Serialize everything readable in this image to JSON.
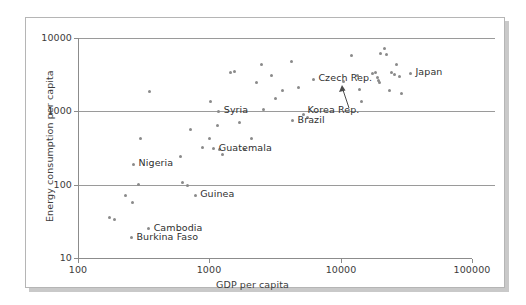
{
  "chart_data": {
    "type": "scatter",
    "title": "",
    "xlabel": "GDP per capita",
    "ylabel": "Energy consumption per capita",
    "xscale": "log",
    "yscale": "log",
    "xlim": [
      100,
      100000
    ],
    "ylim": [
      10,
      10000
    ],
    "xticks": [
      "100",
      "1000",
      "10000",
      "100000"
    ],
    "yticks": [
      "10",
      "100",
      "1000",
      "10000"
    ],
    "grid": "horizontal",
    "legend": "none",
    "labeled_points": [
      {
        "label": "Nigeria",
        "x": 265,
        "y": 190,
        "label_side": "right"
      },
      {
        "label": "Guinea",
        "x": 780,
        "y": 72,
        "label_side": "right"
      },
      {
        "label": "Cambodia",
        "x": 345,
        "y": 25,
        "label_side": "right"
      },
      {
        "label": "Burkina Faso",
        "x": 255,
        "y": 19,
        "label_side": "right"
      },
      {
        "label": "Guatemala",
        "x": 1080,
        "y": 310,
        "label_side": "right"
      },
      {
        "label": "Syria",
        "x": 1180,
        "y": 1000,
        "label_side": "right"
      },
      {
        "label": "Brazil",
        "x": 4300,
        "y": 740,
        "label_side": "right"
      },
      {
        "label": "Czech Rep.",
        "x": 6200,
        "y": 2750,
        "label_side": "right"
      },
      {
        "label": "Korea Rep.",
        "x": 10500,
        "y": 2550,
        "label_side": "below-arrow"
      },
      {
        "label": "Japan",
        "x": 34000,
        "y": 3300,
        "label_side": "right"
      }
    ],
    "unlabeled_points": [
      {
        "x": 175,
        "y": 36
      },
      {
        "x": 190,
        "y": 33
      },
      {
        "x": 230,
        "y": 72
      },
      {
        "x": 260,
        "y": 58
      },
      {
        "x": 290,
        "y": 100
      },
      {
        "x": 300,
        "y": 420
      },
      {
        "x": 350,
        "y": 1850
      },
      {
        "x": 600,
        "y": 240
      },
      {
        "x": 620,
        "y": 107
      },
      {
        "x": 680,
        "y": 98
      },
      {
        "x": 720,
        "y": 560
      },
      {
        "x": 880,
        "y": 320
      },
      {
        "x": 1000,
        "y": 430
      },
      {
        "x": 1020,
        "y": 1350
      },
      {
        "x": 1150,
        "y": 640
      },
      {
        "x": 1200,
        "y": 300
      },
      {
        "x": 1250,
        "y": 260
      },
      {
        "x": 1450,
        "y": 3400
      },
      {
        "x": 1550,
        "y": 3500
      },
      {
        "x": 1700,
        "y": 700
      },
      {
        "x": 1850,
        "y": 300
      },
      {
        "x": 2100,
        "y": 430
      },
      {
        "x": 2300,
        "y": 2450
      },
      {
        "x": 2500,
        "y": 4300
      },
      {
        "x": 2600,
        "y": 1050
      },
      {
        "x": 3000,
        "y": 3050
      },
      {
        "x": 3200,
        "y": 1500
      },
      {
        "x": 3600,
        "y": 1950
      },
      {
        "x": 4200,
        "y": 4800
      },
      {
        "x": 4800,
        "y": 2100
      },
      {
        "x": 5200,
        "y": 900
      },
      {
        "x": 5600,
        "y": 820
      },
      {
        "x": 12000,
        "y": 5700
      },
      {
        "x": 13500,
        "y": 3050
      },
      {
        "x": 14000,
        "y": 2000
      },
      {
        "x": 14500,
        "y": 1350
      },
      {
        "x": 17500,
        "y": 3300
      },
      {
        "x": 18500,
        "y": 3400
      },
      {
        "x": 19000,
        "y": 2900
      },
      {
        "x": 19500,
        "y": 2650
      },
      {
        "x": 19800,
        "y": 2500
      },
      {
        "x": 20000,
        "y": 6200
      },
      {
        "x": 21500,
        "y": 7200
      },
      {
        "x": 22500,
        "y": 5900
      },
      {
        "x": 23500,
        "y": 1900
      },
      {
        "x": 24500,
        "y": 3400
      },
      {
        "x": 25500,
        "y": 3150
      },
      {
        "x": 26500,
        "y": 4350
      },
      {
        "x": 28000,
        "y": 3000
      },
      {
        "x": 29000,
        "y": 1750
      }
    ]
  },
  "axes": {
    "x_title": "GDP per capita",
    "y_title": "Energy consumption per capita",
    "x_ticks": [
      {
        "label": "100",
        "value": 100
      },
      {
        "label": "1000",
        "value": 1000
      },
      {
        "label": "10000",
        "value": 10000
      },
      {
        "label": "100000",
        "value": 100000
      }
    ],
    "y_ticks": [
      {
        "label": "10",
        "value": 10
      },
      {
        "label": "100",
        "value": 100
      },
      {
        "label": "1000",
        "value": 1000
      },
      {
        "label": "10000",
        "value": 10000
      }
    ]
  },
  "colors": {
    "point": "#8a8a8a",
    "gridline": "#9a9a9a",
    "axis": "#8c8c8c",
    "text": "#2f2f2f",
    "frame_border": "#b5b5b5",
    "frame_shadow": "#c9c9c9",
    "background": "#ffffff"
  }
}
